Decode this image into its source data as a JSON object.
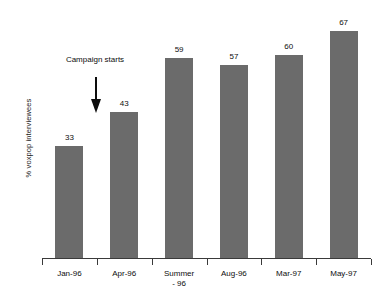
{
  "chart_data": {
    "type": "bar",
    "title": "",
    "subtitle": "",
    "xlabel": "",
    "ylabel": "% voxpop interviewees",
    "categories": [
      "Jan-96",
      "Apr-96",
      "Summer\n- 96",
      "Aug-96",
      "Mar-97",
      "May-97"
    ],
    "values": [
      33,
      43,
      59,
      57,
      60,
      67
    ],
    "value_labels": [
      "33",
      "43",
      "59",
      "57",
      "60",
      "67"
    ],
    "ylim": [
      0,
      67
    ],
    "grid": false,
    "legend": null,
    "legend_position": "none",
    "bar_color": "#6b6b6b",
    "axis_color": "#3a3a3a",
    "text_color": "#0d0d0d",
    "annotations": [
      {
        "text": "Campaign starts",
        "kind": "arrow-down",
        "points_to_category": "Apr-96"
      }
    ]
  },
  "axis": {
    "y_title": "% voxpop interviewees"
  },
  "annotation": {
    "label": "Campaign starts"
  },
  "bars": [
    {
      "label": "Jan-96",
      "value_label": "33"
    },
    {
      "label": "Apr-96",
      "value_label": "43"
    },
    {
      "label": "Summer\n- 96",
      "value_label": "59"
    },
    {
      "label": "Aug-96",
      "value_label": "57"
    },
    {
      "label": "Mar-97",
      "value_label": "60"
    },
    {
      "label": "May-97",
      "value_label": "67"
    }
  ]
}
